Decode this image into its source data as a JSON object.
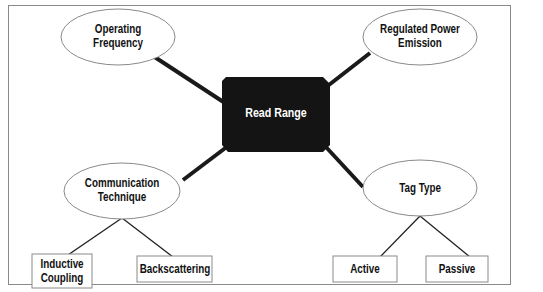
{
  "diagram": {
    "center": {
      "label": "Read Range",
      "fill": "#141414",
      "text_color": "#ffffff"
    },
    "factors": [
      {
        "id": "operating-frequency",
        "label_line1": "Operating",
        "label_line2": "Frequency",
        "shape": "ellipse"
      },
      {
        "id": "regulated-power-emission",
        "label_line1": "Regulated Power",
        "label_line2": "Emission",
        "shape": "ellipse"
      },
      {
        "id": "communication-technique",
        "label_line1": "Communication",
        "label_line2": "Technique",
        "shape": "ellipse"
      },
      {
        "id": "tag-type",
        "label_line1": "Tag Type",
        "label_line2": "",
        "shape": "ellipse"
      }
    ],
    "sub_items": {
      "communication-technique": [
        {
          "label_line1": "Inductive",
          "label_line2": "Coupling"
        },
        {
          "label_line1": "Backscattering",
          "label_line2": ""
        }
      ],
      "tag-type": [
        {
          "label_line1": "Active",
          "label_line2": ""
        },
        {
          "label_line1": "Passive",
          "label_line2": ""
        }
      ]
    },
    "colors": {
      "ellipse_stroke": "#8a8a8a",
      "thick_connector": "#1a1a1a",
      "thin_connector": "#222222",
      "box_stroke": "#8a8a8a",
      "frame_border": "#8a8a8a"
    }
  }
}
